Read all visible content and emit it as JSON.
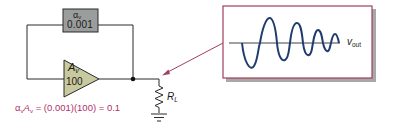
{
  "diagram": {
    "feedback_block": {
      "symbol": "α",
      "symbol_sub": "v",
      "value": "0.001",
      "fill_color": "#9a9d9c"
    },
    "amplifier": {
      "symbol": "A",
      "symbol_sub": "v",
      "value": "100",
      "fill_color": "#c9c9a0"
    },
    "load_resistor": {
      "symbol": "R",
      "symbol_sub": "L"
    },
    "equation": {
      "alpha": "α",
      "alpha_sub": "v",
      "gain": "A",
      "gain_sub": "v",
      "rest": " = (0.001)(100) = 0.1",
      "color": "#b0306a"
    },
    "output_panel": {
      "label": "v",
      "label_sub": "out",
      "border_color": "#a0405a",
      "waveform_color": "#1f3c6e",
      "waveform_description": "sinusoid with decreasing amplitude and increasing frequency"
    },
    "arrow_color": "#a0405a"
  }
}
